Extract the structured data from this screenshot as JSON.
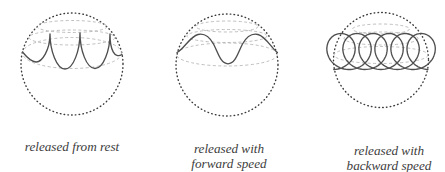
{
  "figure": {
    "panels": [
      {
        "id": "released-from-rest",
        "trajectory_style": "cusped-arcs",
        "caption_lines": [
          "released from rest"
        ]
      },
      {
        "id": "released-with-forward-speed",
        "trajectory_style": "smooth-waves",
        "caption_lines": [
          "released with",
          "forward speed"
        ]
      },
      {
        "id": "released-with-backward-speed",
        "trajectory_style": "loops",
        "caption_lines": [
          "released with",
          "backward speed"
        ]
      }
    ],
    "colors": {
      "background": "#ffffff",
      "sphere_outline": "#3a3a3a",
      "latitude_lines": "#b4b4b4",
      "trajectory": "#4f4f4f",
      "caption_text": "#3d3d3d"
    }
  }
}
